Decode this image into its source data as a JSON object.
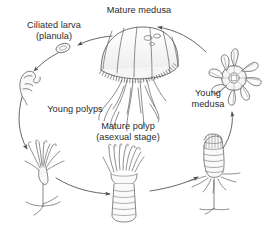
{
  "diagram": {
    "background_color": "#ffffff",
    "ink_color": "#555555",
    "text_color": "#2b2b2b",
    "labels": {
      "mature_medusa": "Mature medusa",
      "ciliated_larva": "Ciliated larva\n(planula)",
      "young_medusa": "Young\nmedusa",
      "young_polyps": "Young polyps",
      "mature_polyp": "Mature polyp\n(asexual stage)"
    },
    "stages": [
      {
        "id": "mature-medusa",
        "label": "Mature medusa",
        "icon": "jellyfish-bell-icon",
        "position": "top-center"
      },
      {
        "id": "ciliated-larva",
        "label": "Ciliated larva (planula)",
        "icon": "planula-oval-icon",
        "position": "upper-left"
      },
      {
        "id": "settling-polyp",
        "label": "",
        "icon": "settling-polyp-icon",
        "position": "left"
      },
      {
        "id": "young-polyps",
        "label": "Young polyps",
        "icon": "young-polyp-cluster-icon",
        "position": "lower-left"
      },
      {
        "id": "mature-polyp",
        "label": "Mature polyp (asexual stage)",
        "icon": "scyphistoma-polyp-icon",
        "position": "bottom-center"
      },
      {
        "id": "strobila",
        "label": "",
        "icon": "strobila-segmented-icon",
        "position": "lower-right"
      },
      {
        "id": "young-medusa",
        "label": "Young medusa",
        "icon": "ephyra-star-icon",
        "position": "right"
      }
    ],
    "arrows": [
      {
        "id": "arrow-medusa-to-planula",
        "from": "mature-medusa",
        "to": "ciliated-larva"
      },
      {
        "id": "arrow-planula-to-settling",
        "from": "ciliated-larva",
        "to": "settling-polyp"
      },
      {
        "id": "arrow-settling-to-young",
        "from": "settling-polyp",
        "to": "young-polyps"
      },
      {
        "id": "arrow-young-to-mature",
        "from": "young-polyps",
        "to": "mature-polyp"
      },
      {
        "id": "arrow-mature-to-strobila",
        "from": "mature-polyp",
        "to": "strobila"
      },
      {
        "id": "arrow-strobila-to-ephyra",
        "from": "strobila",
        "to": "young-medusa"
      },
      {
        "id": "arrow-ephyra-to-medusa",
        "from": "young-medusa",
        "to": "mature-medusa"
      }
    ]
  }
}
